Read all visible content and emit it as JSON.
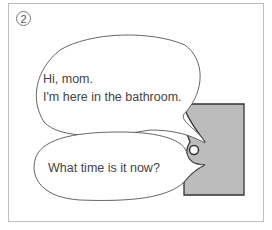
{
  "panel": {
    "number": "2",
    "bubble1": {
      "line1": "Hi, mom.",
      "line2": "I'm here in the bathroom."
    },
    "bubble2": {
      "text": "What time is it now?"
    }
  },
  "colors": {
    "door_fill": "#bcbcbc",
    "door_stroke": "#333333",
    "bubble_stroke": "#555555"
  }
}
